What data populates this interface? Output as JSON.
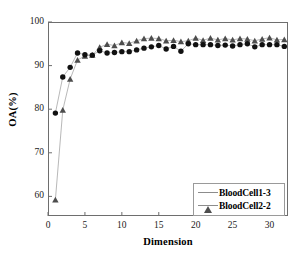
{
  "chart_data": {
    "type": "scatter",
    "title": "",
    "xlabel": "Dimension",
    "ylabel": "OA(%)",
    "xlim": [
      0,
      32.5
    ],
    "ylim": [
      55.5,
      100
    ],
    "xticks": [
      0,
      5,
      10,
      15,
      20,
      25,
      30
    ],
    "yticks": [
      60,
      70,
      80,
      90,
      100
    ],
    "grid": false,
    "legend_position": "lower right",
    "x": [
      1,
      2,
      3,
      4,
      5,
      6,
      7,
      8,
      9,
      10,
      11,
      12,
      13,
      14,
      15,
      16,
      17,
      18,
      19,
      20,
      21,
      22,
      23,
      24,
      25,
      26,
      27,
      28,
      29,
      30,
      31,
      32
    ],
    "series": [
      {
        "name": "BloodCell1-3",
        "marker": "triangle",
        "color": "#4d4d4d",
        "values": [
          59.2,
          79.8,
          86.9,
          91.3,
          92.2,
          92.4,
          94.2,
          94.9,
          94.6,
          95.3,
          95.1,
          95.7,
          96.2,
          96.3,
          96.2,
          95.7,
          95.8,
          95.5,
          95.7,
          96.3,
          95.8,
          96.3,
          95.9,
          96.2,
          95.9,
          96.2,
          96.1,
          95.7,
          96.1,
          96.4,
          95.9,
          96.0
        ]
      },
      {
        "name": "BloodCell2-2",
        "marker": "circle",
        "color": "#111111",
        "values": [
          79.1,
          87.4,
          89.6,
          92.9,
          92.5,
          92.4,
          93.4,
          92.9,
          93.0,
          93.2,
          93.2,
          93.6,
          94.0,
          94.3,
          94.6,
          93.8,
          94.4,
          93.3,
          95.0,
          94.8,
          94.8,
          94.8,
          94.6,
          94.7,
          94.5,
          94.8,
          95.0,
          94.3,
          94.8,
          94.8,
          94.8,
          94.4
        ]
      }
    ]
  },
  "axes": {
    "ytick_labels": [
      "100",
      "90",
      "80",
      "70",
      "60"
    ],
    "xtick_labels": [
      "0",
      "5",
      "10",
      "15",
      "20",
      "25",
      "30"
    ],
    "xaxis_title": "Dimension",
    "yaxis_title": "OA(%)"
  },
  "legend": {
    "items": [
      {
        "label": "BloodCell1-3",
        "marker": "triangle-marker"
      },
      {
        "label": "BloodCell2-2",
        "marker": "circle-marker"
      }
    ]
  }
}
